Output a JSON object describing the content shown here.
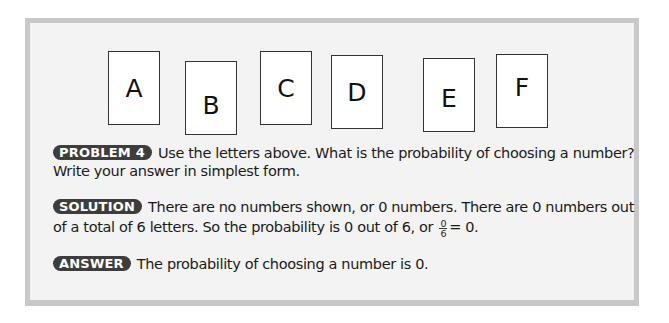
{
  "cards": [
    {
      "letter": "A"
    },
    {
      "letter": "B"
    },
    {
      "letter": "C"
    },
    {
      "letter": "D"
    },
    {
      "letter": "E"
    },
    {
      "letter": "F"
    }
  ],
  "problem": {
    "badge": "PROBLEM 4",
    "line1": "Use the letters above. What is the probability of choosing a number?",
    "line2": "Write your answer in simplest form."
  },
  "solution": {
    "badge": "SOLUTION",
    "line1": "There are no numbers shown, or 0 numbers. There are 0 numbers out",
    "line2_pre": "of a total of 6 letters. So the probability is 0 out of 6, or",
    "fraction_numerator": "0",
    "fraction_denominator": "6",
    "line2_post": "= 0."
  },
  "answer": {
    "badge": "ANSWER",
    "text": "The probability of choosing a number is 0."
  },
  "colors": {
    "panel_background": "#f3f3f3",
    "panel_border": "#c9c9c9",
    "badge_background": "#3d3d3d",
    "badge_text": "#ffffff"
  }
}
